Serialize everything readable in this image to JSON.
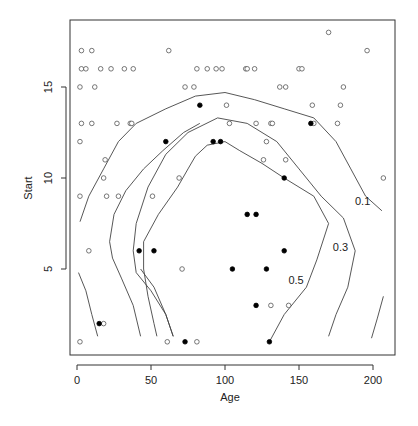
{
  "chart_data": {
    "type": "scatter",
    "title": "",
    "xlabel": "Age",
    "ylabel": "Start",
    "xlim": [
      -5,
      215
    ],
    "ylim": [
      0.3,
      18.6
    ],
    "xticks": [
      0,
      50,
      100,
      150,
      200
    ],
    "yticks": [
      5,
      10,
      15
    ],
    "grid": false,
    "legend": null,
    "series": [
      {
        "name": "absent",
        "marker": "open-circle",
        "points": [
          [
            3,
            17
          ],
          [
            10,
            17
          ],
          [
            62,
            17
          ],
          [
            170,
            18
          ],
          [
            196,
            17
          ],
          [
            3,
            16
          ],
          [
            6,
            16
          ],
          [
            16,
            16
          ],
          [
            23,
            16
          ],
          [
            32,
            16
          ],
          [
            38,
            16
          ],
          [
            81,
            16
          ],
          [
            88,
            16
          ],
          [
            94,
            16
          ],
          [
            98,
            16
          ],
          [
            114,
            16
          ],
          [
            115,
            16
          ],
          [
            120,
            16
          ],
          [
            150,
            16
          ],
          [
            152,
            16
          ],
          [
            2,
            15
          ],
          [
            12,
            15
          ],
          [
            73,
            15
          ],
          [
            79,
            15
          ],
          [
            137,
            15
          ],
          [
            141,
            15
          ],
          [
            180,
            15
          ],
          [
            101,
            14
          ],
          [
            159,
            14
          ],
          [
            178,
            14
          ],
          [
            3,
            13
          ],
          [
            10,
            13
          ],
          [
            27,
            13
          ],
          [
            36,
            13
          ],
          [
            37,
            13
          ],
          [
            103,
            13
          ],
          [
            121,
            13
          ],
          [
            131,
            13
          ],
          [
            132,
            13
          ],
          [
            160,
            13
          ],
          [
            176,
            13
          ],
          [
            2,
            12
          ],
          [
            128,
            12
          ],
          [
            19,
            11
          ],
          [
            126,
            11
          ],
          [
            141,
            11
          ],
          [
            18,
            10
          ],
          [
            69,
            10
          ],
          [
            207,
            10
          ],
          [
            2,
            9
          ],
          [
            20,
            9
          ],
          [
            28,
            9
          ],
          [
            51,
            9
          ],
          [
            8,
            6
          ],
          [
            71,
            5
          ],
          [
            131,
            3
          ],
          [
            143,
            3
          ],
          [
            18,
            2
          ],
          [
            2,
            1
          ],
          [
            61,
            1
          ],
          [
            81,
            1
          ]
        ]
      },
      {
        "name": "present",
        "marker": "filled-circle",
        "points": [
          [
            83,
            14
          ],
          [
            158,
            13
          ],
          [
            60,
            12
          ],
          [
            92,
            12
          ],
          [
            97,
            12
          ],
          [
            140,
            10
          ],
          [
            115,
            8
          ],
          [
            121,
            8
          ],
          [
            42,
            6
          ],
          [
            52,
            6
          ],
          [
            140,
            6
          ],
          [
            105,
            5
          ],
          [
            128,
            5
          ],
          [
            121,
            3
          ],
          [
            15,
            2
          ],
          [
            73,
            1
          ],
          [
            130,
            1
          ]
        ]
      }
    ],
    "contours": [
      {
        "level": "0.1",
        "label": "0.1",
        "paths": [
          [
            [
              2,
              7.6
            ],
            [
              8,
              9
            ],
            [
              18,
              10.5
            ],
            [
              28,
              12
            ],
            [
              40,
              13
            ],
            [
              60,
              13.8
            ],
            [
              80,
              14.5
            ],
            [
              100,
              14.7
            ],
            [
              120,
              14.3
            ],
            [
              140,
              13.8
            ],
            [
              160,
              13.3
            ],
            [
              175,
              12
            ],
            [
              185,
              10.5
            ],
            [
              195,
              9
            ],
            [
              206,
              8.2
            ]
          ],
          [
            [
              1,
              4.8
            ],
            [
              6,
              3.8
            ],
            [
              10,
              2.5
            ],
            [
              14,
              1.3
            ]
          ],
          [
            [
              207,
              3.5
            ],
            [
              203,
              2.3
            ],
            [
              199,
              1.2
            ]
          ]
        ],
        "label_at": [
          193,
          8.5
        ]
      },
      {
        "level": "0.3",
        "label": "0.3",
        "paths": [
          [
            [
              65,
              1.3
            ],
            [
              60,
              2.5
            ],
            [
              50,
              3.8
            ],
            [
              40,
              4.8
            ],
            [
              38,
              6
            ],
            [
              40,
              7.5
            ],
            [
              48,
              9.5
            ],
            [
              60,
              11.3
            ],
            [
              75,
              12.5
            ],
            [
              95,
              13.3
            ],
            [
              115,
              13
            ],
            [
              135,
              12
            ],
            [
              150,
              10.5
            ],
            [
              165,
              9
            ],
            [
              180,
              7.8
            ],
            [
              188,
              6
            ],
            [
              183,
              4
            ],
            [
              175,
              2.5
            ],
            [
              170,
              1.3
            ]
          ],
          [
            [
              65,
              1.3
            ],
            [
              60,
              2.5
            ],
            [
              52,
              4
            ],
            [
              43,
              5
            ]
          ]
        ],
        "label_at": [
          178,
          6
        ]
      },
      {
        "level": "0.5",
        "label": "0.5",
        "paths": [
          [
            [
              43,
              1.3
            ],
            [
              38,
              3
            ],
            [
              30,
              4.5
            ],
            [
              24,
              5.6
            ],
            [
              22,
              6.5
            ],
            [
              25,
              8
            ],
            [
              33,
              9.3
            ],
            [
              45,
              10.5
            ],
            [
              58,
              11.5
            ],
            [
              72,
              12.5
            ],
            [
              83,
              13
            ]
          ],
          [
            [
              130,
              1
            ],
            [
              140,
              2.5
            ],
            [
              155,
              4
            ],
            [
              162,
              5.5
            ],
            [
              170,
              7.5
            ],
            [
              160,
              9
            ],
            [
              140,
              10
            ],
            [
              125,
              10.8
            ],
            [
              110,
              11.5
            ],
            [
              100,
              12
            ],
            [
              88,
              11.8
            ],
            [
              80,
              11.2
            ],
            [
              75,
              10.5
            ],
            [
              68,
              9.5
            ],
            [
              55,
              8
            ],
            [
              45,
              6.5
            ],
            [
              45,
              5
            ],
            [
              48,
              3.5
            ],
            [
              52,
              2
            ],
            [
              54,
              1.3
            ]
          ]
        ],
        "label_at": [
          148,
          4.2
        ]
      }
    ]
  }
}
